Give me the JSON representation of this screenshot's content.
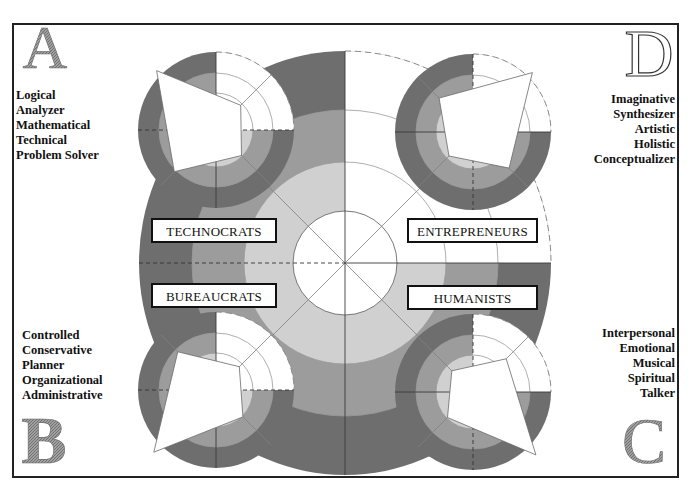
{
  "quadrants": {
    "A": {
      "letter": "A",
      "label": "TECHNOCRATS",
      "traits": [
        "Logical",
        "Analyzer",
        "Mathematical",
        "Technical",
        "Problem Solver"
      ]
    },
    "B": {
      "letter": "B",
      "label": "BUREAUCRATS",
      "traits": [
        "Controlled",
        "Conservative",
        "Planner",
        "Organizational",
        "Administrative"
      ]
    },
    "C": {
      "letter": "C",
      "label": "HUMANISTS",
      "traits": [
        "Interpersonal",
        "Emotional",
        "Musical",
        "Spiritual",
        "Talker"
      ]
    },
    "D": {
      "letter": "D",
      "label": "ENTREPRENEURS",
      "traits": [
        "Imaginative",
        "Synthesizer",
        "Artistic",
        "Holistic",
        "Conceptualizer"
      ]
    }
  },
  "profile_wheels": {
    "technocrats": {
      "A": 84,
      "D": 35,
      "C": 36,
      "B": 59
    },
    "entrepreneurs": {
      "A": 48,
      "D": 84,
      "C": 51,
      "B": 34
    },
    "bureaucrats": {
      "A": 54,
      "D": 33,
      "C": 38,
      "B": 88
    },
    "humanists": {
      "A": 30,
      "D": 47,
      "C": 89,
      "B": 36
    }
  },
  "colors": {
    "dark_ring": "#6e6e6e",
    "medium_ring": "#9c9c9c",
    "light_ring": "#d0d0d0",
    "letter_gray": "#8a8a8a",
    "ink": "#111111"
  }
}
